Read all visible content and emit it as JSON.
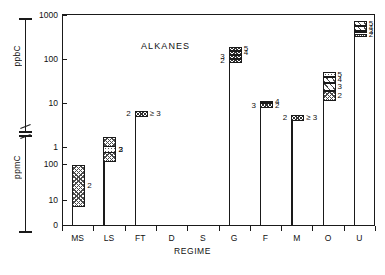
{
  "chart_data": {
    "type": "bar",
    "title": "ALKANES",
    "xlabel": "REGIME",
    "ylabel_upper": "ppbC",
    "ylabel_lower": "ppmC",
    "grid": false,
    "legend": "none",
    "axis_note": "Broken dual-range logarithmic y-axis: lower block in ppmC (0, 10, 100), upper block in ppbC (1, 10, 100, 1000)",
    "ytick_labels_upper": [
      "1000",
      "100",
      "10",
      "1"
    ],
    "ytick_labels_lower": [
      "100",
      "10",
      "0"
    ],
    "categories": [
      "MS",
      "LS",
      "FT",
      "D",
      "S",
      "G",
      "F",
      "M",
      "O",
      "U"
    ],
    "category_names": {
      "MS": "MS",
      "LS": "LS",
      "FT": "FT",
      "D": "D",
      "S": "S",
      "G": "G",
      "F": "F",
      "M": "M",
      "O": "O",
      "U": "U"
    },
    "segment_label_legend": "Numbers denote carbon number of alkane fraction",
    "bars": [
      {
        "category": "MS",
        "segments": [
          {
            "label": "2",
            "label_side": "right",
            "low": 7,
            "high": 100,
            "unit": "ppmC",
            "fill": "check"
          }
        ]
      },
      {
        "category": "LS",
        "segments": [
          {
            "label": "2",
            "label_side": "right",
            "low": 120,
            "high": 600,
            "unit": "ppmC",
            "fill": "check"
          },
          {
            "label": "3",
            "label_side": "right",
            "low": 0.75,
            "high": 1.1,
            "unit": "ppbC",
            "fill": "dot"
          }
        ]
      },
      {
        "category": "FT",
        "segments": [
          {
            "label": "2",
            "label_side": "left",
            "low": 5.0,
            "high": 7.0,
            "unit": "ppbC",
            "fill": "dense"
          },
          {
            "label": "≥ 3",
            "label_side": "right",
            "low": 5.0,
            "high": 7.0,
            "unit": "ppbC",
            "fill": "dense"
          }
        ]
      },
      {
        "category": "D",
        "segments": []
      },
      {
        "category": "S",
        "segments": []
      },
      {
        "category": "G",
        "segments": [
          {
            "label": "2",
            "label_side": "left",
            "low": 85,
            "high": 105,
            "unit": "ppbC",
            "fill": "dense"
          },
          {
            "label": "3",
            "label_side": "left",
            "low": 105,
            "high": 130,
            "unit": "ppbC",
            "fill": "dense"
          },
          {
            "label": "4",
            "label_side": "right",
            "low": 130,
            "high": 160,
            "unit": "ppbC",
            "fill": "dense"
          },
          {
            "label": "5",
            "label_side": "right",
            "low": 160,
            "high": 200,
            "unit": "ppbC",
            "fill": "dense"
          }
        ]
      },
      {
        "category": "F",
        "segments": [
          {
            "label": "3",
            "label_side": "left",
            "low": 8.0,
            "high": 10.5,
            "unit": "ppbC",
            "fill": "dense"
          },
          {
            "label": "2",
            "label_side": "right",
            "low": 8.0,
            "high": 10.5,
            "unit": "ppbC",
            "fill": "dense"
          },
          {
            "label": "4",
            "label_side": "right",
            "low": 10.5,
            "high": 12.0,
            "unit": "ppbC",
            "fill": "dense"
          }
        ]
      },
      {
        "category": "M",
        "segments": [
          {
            "label": "2",
            "label_side": "left",
            "low": 4.2,
            "high": 5.6,
            "unit": "ppbC",
            "fill": "dense"
          },
          {
            "label": "≥ 3",
            "label_side": "right",
            "low": 4.2,
            "high": 5.6,
            "unit": "ppbC",
            "fill": "dense"
          }
        ]
      },
      {
        "category": "O",
        "segments": [
          {
            "label": "2",
            "label_side": "right",
            "low": 12,
            "high": 20,
            "unit": "ppbC",
            "fill": "check"
          },
          {
            "label": "3",
            "label_side": "right",
            "low": 20,
            "high": 30,
            "unit": "ppbC",
            "fill": "diag"
          },
          {
            "label": "4",
            "label_side": "right",
            "low": 30,
            "high": 42,
            "unit": "ppbC",
            "fill": "diag"
          },
          {
            "label": "5",
            "label_side": "right",
            "low": 42,
            "high": 52,
            "unit": "ppbC",
            "fill": "dot"
          }
        ]
      },
      {
        "category": "U",
        "segments": [
          {
            "label": "2",
            "label_side": "right",
            "low": 330,
            "high": 400,
            "unit": "ppbC",
            "fill": "check"
          },
          {
            "label": "3",
            "label_side": "right",
            "low": 400,
            "high": 460,
            "unit": "ppbC",
            "fill": "dense"
          },
          {
            "label": "4",
            "label_side": "right",
            "low": 460,
            "high": 600,
            "unit": "ppbC",
            "fill": "diag"
          },
          {
            "label": "5",
            "label_side": "right",
            "low": 600,
            "high": 760,
            "unit": "ppbC",
            "fill": "diag"
          }
        ]
      }
    ]
  }
}
